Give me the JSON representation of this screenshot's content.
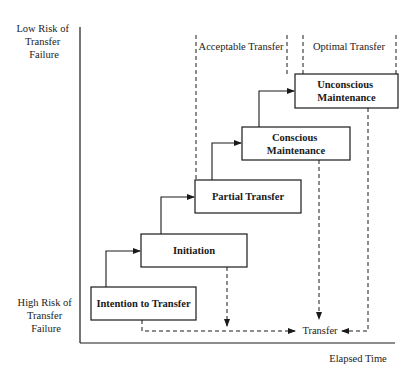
{
  "axes": {
    "y_top_label": [
      "Low Risk of",
      "Transfer",
      "Failure"
    ],
    "y_bottom_label": [
      "High Risk of",
      "Transfer",
      "Failure"
    ],
    "x_label": "Elapsed Time"
  },
  "zones": [
    {
      "label": "Acceptable Transfer"
    },
    {
      "label": "Optimal Transfer"
    }
  ],
  "stages": [
    {
      "lines": [
        "Intention to Transfer"
      ]
    },
    {
      "lines": [
        "Initiation"
      ]
    },
    {
      "lines": [
        "Partial Transfer"
      ]
    },
    {
      "lines": [
        "Conscious",
        "Maintenance"
      ]
    },
    {
      "lines": [
        "Unconscious",
        "Maintenance"
      ]
    }
  ],
  "outcome": {
    "label": "Transfer"
  },
  "colors": {
    "line": "#1a1a1a",
    "background": "#ffffff"
  }
}
